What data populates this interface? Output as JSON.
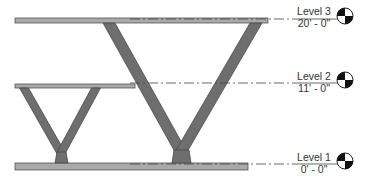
{
  "view": {
    "type": "elevation",
    "colors": {
      "background": "#ffffff",
      "slab_fill": "#a9a9a9",
      "slab_edge": "#555555",
      "brace_fill": "#6e6e6e",
      "brace_edge": "#4a4a4a",
      "level_line": "#444444",
      "text": "#333333"
    }
  },
  "levels": [
    {
      "name": "Level 3",
      "elevation": "20' - 0\"",
      "y": 19
    },
    {
      "name": "Level 2",
      "elevation": "11' - 0\"",
      "y": 83
    },
    {
      "name": "Level 1",
      "elevation": "0' - 0\"",
      "y": 164
    }
  ],
  "slabs": [
    {
      "id": "roof-slab",
      "x1": 15,
      "x2": 268,
      "y": 18,
      "h": 5
    },
    {
      "id": "level2-slab",
      "x1": 15,
      "x2": 135,
      "y": 84,
      "h": 4
    },
    {
      "id": "ground-slab",
      "x1": 15,
      "x2": 248,
      "y": 163,
      "h": 7
    }
  ],
  "braces": [
    {
      "id": "small-v-left",
      "top": [
        24,
        88
      ],
      "bottom": [
        61,
        153
      ],
      "w": 9
    },
    {
      "id": "small-v-right",
      "top": [
        96,
        88
      ],
      "bottom": [
        61,
        153
      ],
      "w": 9
    },
    {
      "id": "big-v-left",
      "top": [
        109,
        23
      ],
      "bottom": [
        181,
        152
      ],
      "w": 12
    },
    {
      "id": "big-v-right",
      "top": [
        256,
        23
      ],
      "bottom": [
        181,
        152
      ],
      "w": 12
    }
  ],
  "base_plates": [
    {
      "id": "small-v-base",
      "x": 55,
      "w": 13,
      "y": 152,
      "h": 11
    },
    {
      "id": "big-v-base",
      "x": 172,
      "w": 19,
      "y": 150,
      "h": 13
    }
  ]
}
